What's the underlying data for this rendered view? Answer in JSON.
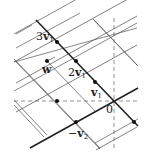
{
  "diagram": {
    "origin": {
      "label": "0",
      "x": 114,
      "y": 101
    },
    "basis": {
      "v1": {
        "dx": -19,
        "dy": -19.7
      },
      "v2": {
        "dx": 38,
        "dy": -21
      }
    },
    "labels": {
      "three_v1": {
        "coef": "3",
        "vec": "v",
        "sub": "1"
      },
      "two_v1": {
        "coef": "2",
        "vec": "v",
        "sub": "1"
      },
      "v1": {
        "coef": "",
        "vec": "v",
        "sub": "1"
      },
      "neg_v2": {
        "coef": "−",
        "vec": "v",
        "sub": "2"
      },
      "w": {
        "vec": "w"
      },
      "zero": "0"
    },
    "points": [
      {
        "name": "3v1",
        "x": 57,
        "y": 42
      },
      {
        "name": "2v1",
        "x": 76,
        "y": 61
      },
      {
        "name": "v1",
        "x": 95,
        "y": 82
      },
      {
        "name": "0",
        "x": 114,
        "y": 101
      },
      {
        "name": "-v2",
        "x": 76,
        "y": 122
      },
      {
        "name": "w",
        "x": 47,
        "y": 61
      },
      {
        "name": "v1-v2",
        "x": 57,
        "y": 101
      },
      {
        "name": "-v1",
        "x": 134,
        "y": 122
      }
    ],
    "axes": {
      "style": "dashed",
      "horizontal_y": 101,
      "vertical_x": 114
    },
    "colors": {
      "line": "#333333",
      "thin_line": "#555555",
      "axis": "#666666",
      "point": "#111111"
    }
  }
}
